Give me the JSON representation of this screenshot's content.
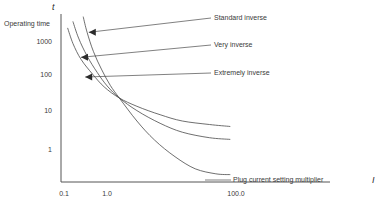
{
  "chart_data": {
    "type": "line",
    "title": "",
    "xlabel": "Plug current setting multiplier",
    "ylabel": "Operating time",
    "x_symbol": "I",
    "y_symbol": "t",
    "xscale": "log",
    "yscale": "log",
    "xlim": [
      0.1,
      100.0
    ],
    "ylim": [
      0.3,
      3000
    ],
    "grid": false,
    "legend_position": "annotations-right",
    "xticks": [
      {
        "value": 0.1,
        "label": "0.1"
      },
      {
        "value": 1.0,
        "label": "1.0"
      },
      {
        "value": 100.0,
        "label": "100.0"
      }
    ],
    "yticks": [
      {
        "value": 1000,
        "label": "1000"
      },
      {
        "value": 100,
        "label": "100"
      },
      {
        "value": 10,
        "label": "10"
      },
      {
        "value": 1,
        "label": "1"
      }
    ],
    "series": [
      {
        "name": "Standard inverse",
        "points": [
          {
            "x": 0.13,
            "y": 1400
          },
          {
            "x": 0.16,
            "y": 600
          },
          {
            "x": 0.22,
            "y": 250
          },
          {
            "x": 0.35,
            "y": 110
          },
          {
            "x": 0.55,
            "y": 55
          },
          {
            "x": 1.0,
            "y": 30
          },
          {
            "x": 2.0,
            "y": 19
          },
          {
            "x": 5.0,
            "y": 12
          },
          {
            "x": 12.0,
            "y": 8.5
          },
          {
            "x": 35.0,
            "y": 7.0
          },
          {
            "x": 80.0,
            "y": 6.3
          }
        ]
      },
      {
        "name": "Very inverse",
        "points": [
          {
            "x": 0.16,
            "y": 2000
          },
          {
            "x": 0.2,
            "y": 800
          },
          {
            "x": 0.28,
            "y": 300
          },
          {
            "x": 0.42,
            "y": 120
          },
          {
            "x": 0.62,
            "y": 58
          },
          {
            "x": 1.0,
            "y": 30
          },
          {
            "x": 2.0,
            "y": 15
          },
          {
            "x": 5.0,
            "y": 7.5
          },
          {
            "x": 12.0,
            "y": 4.6
          },
          {
            "x": 35.0,
            "y": 3.4
          },
          {
            "x": 80.0,
            "y": 3.1
          }
        ]
      },
      {
        "name": "Extremely inverse",
        "points": [
          {
            "x": 0.24,
            "y": 2600
          },
          {
            "x": 0.28,
            "y": 1100
          },
          {
            "x": 0.36,
            "y": 380
          },
          {
            "x": 0.5,
            "y": 140
          },
          {
            "x": 0.7,
            "y": 60
          },
          {
            "x": 1.0,
            "y": 30
          },
          {
            "x": 2.0,
            "y": 8.5
          },
          {
            "x": 4.0,
            "y": 3.0
          },
          {
            "x": 9.0,
            "y": 1.2
          },
          {
            "x": 20.0,
            "y": 0.62
          },
          {
            "x": 45.0,
            "y": 0.47
          },
          {
            "x": 80.0,
            "y": 0.45
          }
        ]
      }
    ],
    "annotations": [
      {
        "label": "Standard inverse",
        "target": {
          "x": 0.3,
          "y": 1100
        }
      },
      {
        "label": "Very inverse",
        "target": {
          "x": 0.22,
          "y": 280
        }
      },
      {
        "label": "Extremely inverse",
        "target": {
          "x": 0.26,
          "y": 95
        }
      }
    ]
  }
}
